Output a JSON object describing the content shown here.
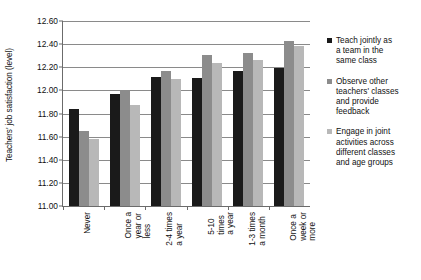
{
  "chart_data": {
    "type": "bar",
    "title": "",
    "xlabel": "",
    "ylabel": "Teachers' job satisfaction (level)",
    "ylim": [
      11.0,
      12.6
    ],
    "ytick_step": 0.2,
    "ytick_labels": [
      "12.60",
      "12.40",
      "12.20",
      "12.00",
      "11.80",
      "11.60",
      "11.40",
      "11.20",
      "11.00"
    ],
    "ytick_values": [
      12.6,
      12.4,
      12.2,
      12.0,
      11.8,
      11.6,
      11.4,
      11.2,
      11.0
    ],
    "grid": true,
    "grid_axis": "y",
    "legend_position": "right",
    "categories": [
      "Never",
      "Once a year or less",
      "2-4 times a year",
      "5-10 times a year",
      "1-3 times a month",
      "Once a week or more"
    ],
    "category_lines": [
      [
        "Never"
      ],
      [
        "Once a",
        "year or",
        "less"
      ],
      [
        "2-4 times",
        "a year"
      ],
      [
        "5-10",
        "times",
        "a year"
      ],
      [
        "1-3 times",
        "a month"
      ],
      [
        "Once a",
        "week or",
        "more"
      ]
    ],
    "series": [
      {
        "name": "Teach jointly as a team in the same class",
        "name_lines": [
          "Teach jointly as",
          "a team in the",
          "same class"
        ],
        "color": "#1a1a1a",
        "values": [
          11.84,
          11.97,
          12.12,
          12.11,
          12.17,
          12.19
        ]
      },
      {
        "name": "Observe other teachers' classes and provide feedback",
        "name_lines": [
          "Observe other",
          "teachers' classes",
          "and provide",
          "feedback"
        ],
        "color": "#8c8c8c",
        "values": [
          11.65,
          12.0,
          12.17,
          12.31,
          12.32,
          12.43
        ]
      },
      {
        "name": "Engage in joint activities across different classes and age groups",
        "name_lines": [
          "Engage in joint",
          "activities across",
          "different classes",
          "and age groups"
        ],
        "color": "#b8b8b8",
        "values": [
          11.58,
          11.87,
          12.1,
          12.24,
          12.26,
          12.38
        ]
      }
    ]
  }
}
